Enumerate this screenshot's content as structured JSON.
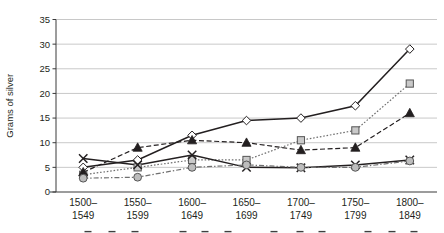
{
  "chart_data": {
    "type": "line",
    "title": "",
    "xlabel": "",
    "ylabel": "Grams of silver",
    "categories": [
      "1500–\n1549",
      "1550–\n1599",
      "1600–\n1649",
      "1650–\n1699",
      "1700–\n1749",
      "1750–\n1799",
      "1800–\n1849"
    ],
    "category_lines": [
      [
        "1500–",
        "1549"
      ],
      [
        "1550–",
        "1599"
      ],
      [
        "1600–",
        "1649"
      ],
      [
        "1650–",
        "1699"
      ],
      [
        "1700–",
        "1749"
      ],
      [
        "1750–",
        "1799"
      ],
      [
        "1800–",
        "1849"
      ]
    ],
    "ylim": [
      0,
      35
    ],
    "yticks": [
      0,
      5,
      10,
      15,
      20,
      25,
      30,
      35
    ],
    "ytick_labels": [
      "0",
      "5",
      "10",
      "15",
      "20",
      "25",
      "30",
      "35"
    ],
    "grid": true,
    "legend_position": "bottom",
    "legend_visible": false,
    "legend_note": "legend row is cropped off at the bottom edge of the image; only the top sliver of marker glyphs is visible",
    "series": [
      {
        "name": "series-diamond",
        "marker": "diamond",
        "line_style": "solid",
        "color": "#231f20",
        "marker_fill": "#ffffff",
        "values": [
          5.0,
          6.5,
          11.5,
          14.5,
          15.0,
          17.5,
          29.0
        ]
      },
      {
        "name": "series-square",
        "marker": "square",
        "line_style": "dotted",
        "color": "#6f6f6f",
        "marker_fill": "#c9c9c9",
        "values": [
          3.5,
          5.0,
          6.5,
          6.5,
          10.5,
          12.5,
          22.0
        ]
      },
      {
        "name": "series-triangle",
        "marker": "triangle",
        "line_style": "dashed",
        "color": "#231f20",
        "marker_fill": "#231f20",
        "values": [
          4.0,
          9.0,
          10.5,
          10.0,
          8.5,
          9.0,
          16.0
        ]
      },
      {
        "name": "series-cross",
        "marker": "cross",
        "line_style": "solid",
        "color": "#231f20",
        "marker_fill": "#231f20",
        "values": [
          6.8,
          5.5,
          7.5,
          5.0,
          4.9,
          5.5,
          6.5
        ]
      },
      {
        "name": "series-circle",
        "marker": "circle",
        "line_style": "dash-dot",
        "color": "#6f6f6f",
        "marker_fill": "#bdbdbd",
        "values": [
          2.8,
          3.0,
          5.0,
          5.5,
          5.0,
          5.0,
          6.3
        ]
      }
    ]
  }
}
